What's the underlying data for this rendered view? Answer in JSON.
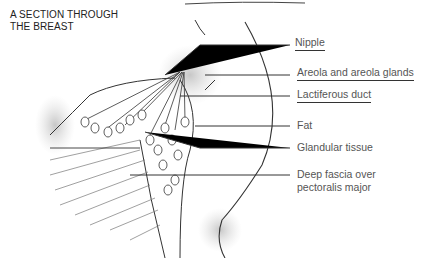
{
  "title": {
    "line1": "A SECTION THROUGH",
    "line2": "THE BREAST"
  },
  "labels": [
    {
      "id": "nipple",
      "text": "Nipple",
      "underlined": true
    },
    {
      "id": "areola",
      "text": "Areola and areola glands",
      "underlined": true
    },
    {
      "id": "lactiferous",
      "text": "Lactiferous duct",
      "underlined": true
    },
    {
      "id": "fat",
      "text": "Fat",
      "underlined": false
    },
    {
      "id": "glandular",
      "text": "Glandular tissue",
      "underlined": false
    },
    {
      "id": "fascia",
      "text": "Deep fascia over",
      "text2": "pectoralis major",
      "underlined": false
    }
  ],
  "colors": {
    "line": "#333333",
    "text": "#555555",
    "shading": "#bbbbbb"
  }
}
